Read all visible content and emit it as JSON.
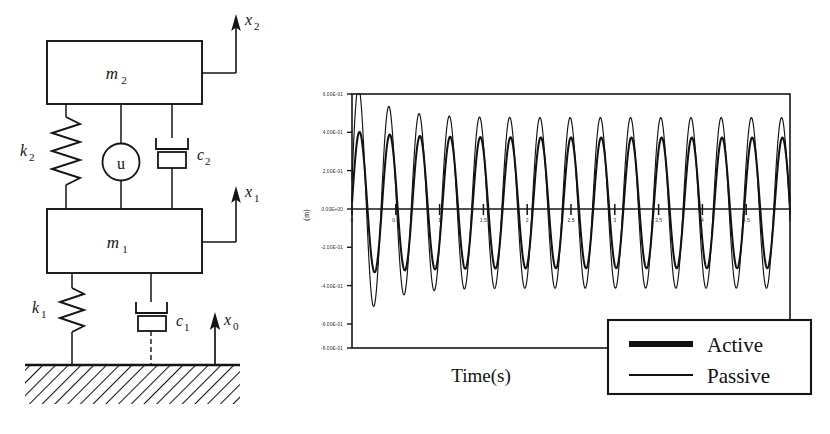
{
  "figure": {
    "ink_color": "#121212",
    "background_color": "#ffffff"
  },
  "schematic": {
    "name": "quarter-car-active-suspension-schematic",
    "masses": [
      {
        "id": "m2",
        "label": "m2",
        "label_base": "m",
        "label_sub": "2"
      },
      {
        "id": "m1",
        "label": "m1",
        "label_base": "m",
        "label_sub": "1"
      }
    ],
    "springs": [
      {
        "id": "k2",
        "label_base": "k",
        "label_sub": "2"
      },
      {
        "id": "k1",
        "label_base": "k",
        "label_sub": "1"
      }
    ],
    "dampers": [
      {
        "id": "c2",
        "label_base": "c",
        "label_sub": "2"
      },
      {
        "id": "c1",
        "label_base": "c",
        "label_sub": "1"
      }
    ],
    "actuator": {
      "id": "u",
      "label": "u"
    },
    "displacements": [
      {
        "id": "x2",
        "label_base": "x",
        "label_sub": "2"
      },
      {
        "id": "x1",
        "label_base": "x",
        "label_sub": "1"
      },
      {
        "id": "x0",
        "label_base": "x",
        "label_sub": "0"
      }
    ],
    "ground": {
      "label": "hatched-ground"
    }
  },
  "chart_data": {
    "type": "line",
    "title": "",
    "xlabel": "Time(s)",
    "ylabel": "(m)",
    "xlim": [
      0,
      5
    ],
    "ylim": [
      -0.8,
      0.6
    ],
    "grid": false,
    "legend_position": "bottom-right",
    "xticks": [
      0,
      0.5,
      1,
      1.5,
      2,
      2.5,
      3,
      3.5,
      4,
      4.5,
      5
    ],
    "xticklabels": [
      "0",
      "0.5",
      "1",
      "1.5",
      "2",
      "2.5",
      "3",
      "3.5",
      "4",
      "4.5",
      "5"
    ],
    "yticks": [
      0.6,
      0.4,
      0.2,
      0.0,
      -0.2,
      -0.4,
      -0.6,
      -0.8
    ],
    "yticklabels": [
      "6.00E-01",
      "4.00E-01",
      "2.00E-01",
      "0.00E+00",
      "-2.00E-01",
      "-4.00E-01",
      "-6.00E-01",
      "-8.00E-01"
    ],
    "series": [
      {
        "name": "Active",
        "style": "thick",
        "amplitude": 0.36,
        "frequency_hz": 2.9,
        "phase": 0.0,
        "color": "#121212"
      },
      {
        "name": "Passive",
        "style": "thin",
        "amplitude": 0.47,
        "frequency_hz": 2.9,
        "phase": 0.18,
        "first_cycle_overshoot": 0.68,
        "color": "#121212"
      }
    ]
  },
  "legend": {
    "name": "series-legend",
    "entries": [
      {
        "label": "Active",
        "style": "thick"
      },
      {
        "label": "Passive",
        "style": "thin"
      }
    ]
  },
  "axis_labels": {
    "x_title": "Time(s)",
    "y_title": "(m)"
  }
}
